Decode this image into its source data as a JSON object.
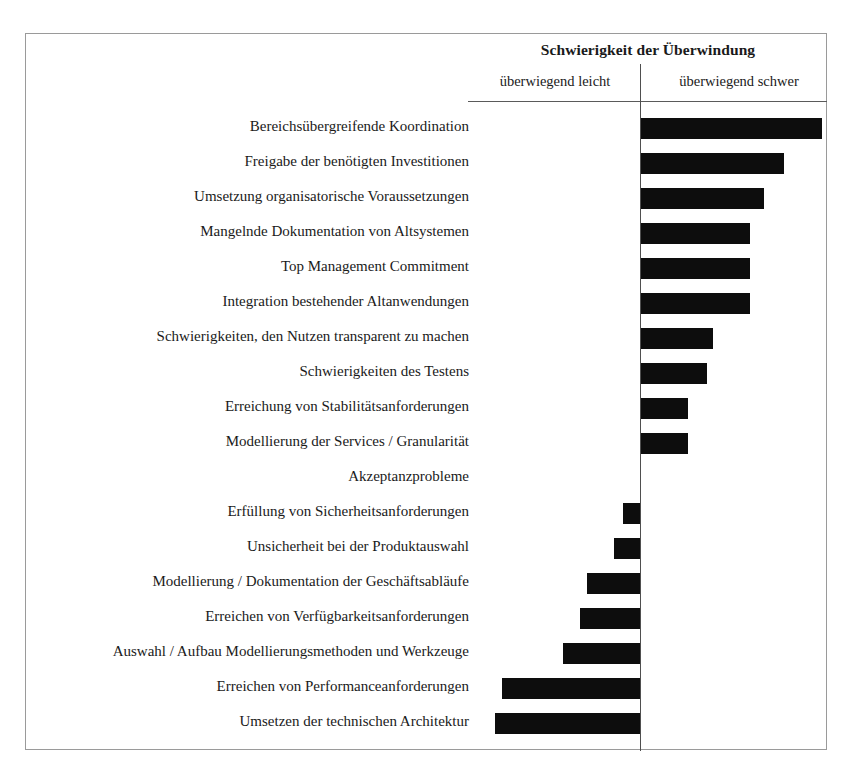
{
  "chart_data": {
    "type": "bar",
    "orientation": "horizontal",
    "title": "Schwierigkeit der Überwindung",
    "xlabel": "",
    "ylabel": "",
    "axis_labels": {
      "left": "überwiegend leicht",
      "right": "überwiegend schwer"
    },
    "grid": false,
    "legend": false,
    "xlim": [
      -100,
      100
    ],
    "zero_line": true,
    "categories": [
      "Bereichsübergreifende Koordination",
      "Freigabe der benötigten Investitionen",
      "Umsetzung organisatorische Voraussetzungen",
      "Mangelnde Dokumentation von Altsystemen",
      "Top Management Commitment",
      "Integration bestehender Altanwendungen",
      "Schwierigkeiten, den Nutzen transparent zu machen",
      "Schwierigkeiten des Testens",
      "Erreichung von Stabilitätsanforderungen",
      "Modellierung der Services / Granularität",
      "Akzeptanzprobleme",
      "Erfüllung von Sicherheitsanforderungen",
      "Unsicherheit bei der Produktauswahl",
      "Modellierung / Dokumentation der Geschäftsabläufe",
      "Erreichen von Verfügbarkeitsanforderungen",
      "Auswahl / Aufbau Modellierungsmethoden und Werkzeuge",
      "Erreichen von Performanceanforderungen",
      "Umsetzen der technischen Architektur"
    ],
    "values": [
      96,
      76,
      65,
      58,
      58,
      58,
      38,
      35,
      25,
      25,
      0,
      -9,
      -14,
      -28,
      -32,
      -41,
      -73,
      -77
    ]
  }
}
